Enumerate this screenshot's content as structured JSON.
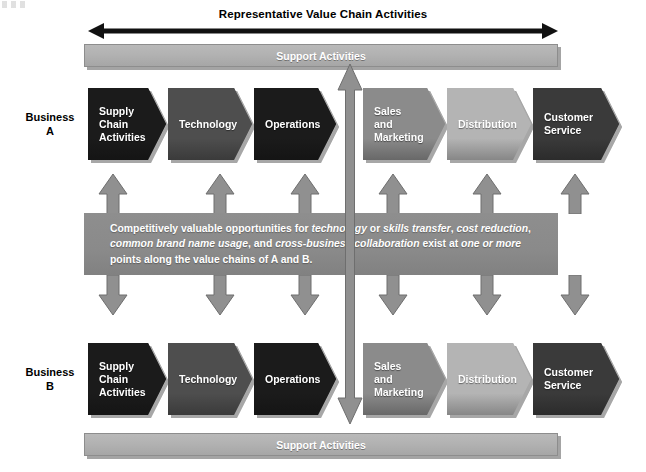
{
  "figure": {
    "top_title": "Representative Value Chain Activities",
    "support_top_label": "Support Activities",
    "support_bottom_label": "Support Activities",
    "business_a_line1": "Business",
    "business_a_line2": "A",
    "business_b_line1": "Business",
    "business_b_line2": "B",
    "center_text_parts": {
      "p1": "Competitively valuable opportunities for ",
      "i1": "technology",
      "p2": " or ",
      "i2": "skills transfer",
      "p3": ", ",
      "i3": "cost reduction",
      "p4": ", ",
      "i4": "common brand name usage",
      "p5": ", and ",
      "i5": "cross-business collaboration",
      "p6": " exist at ",
      "i6": "one or more",
      "p7": " points along the value chains of A and B."
    }
  },
  "chart_data": {
    "type": "diagram",
    "title": "Representative Value Chain Activities",
    "rows": [
      {
        "row_label": "Business A",
        "activities": [
          {
            "label": "Supply Chain Activities",
            "lines": [
              "Supply",
              "Chain",
              "Activities"
            ],
            "color": "#1b1b1b",
            "x": 88,
            "width": 78
          },
          {
            "label": "Technology",
            "lines": [
              "Technology"
            ],
            "color": "#4e4e4e",
            "x": 168,
            "width": 84
          },
          {
            "label": "Operations",
            "lines": [
              "Operations"
            ],
            "color": "#1b1b1b",
            "x": 254,
            "width": 82
          },
          {
            "label": "Sales and Marketing",
            "lines": [
              "Sales",
              "and",
              "Marketing"
            ],
            "color": "#8b8b8b",
            "x": 363,
            "width": 82
          },
          {
            "label": "Distribution",
            "lines": [
              "Distribution"
            ],
            "color": "#b4b4b4",
            "x": 447,
            "width": 84
          },
          {
            "label": "Customer Service",
            "lines": [
              "Customer",
              "Service"
            ],
            "color": "#3a3a3a",
            "x": 533,
            "width": 86
          }
        ]
      },
      {
        "row_label": "Business B",
        "activities": [
          {
            "label": "Supply Chain Activities",
            "lines": [
              "Supply",
              "Chain",
              "Activities"
            ],
            "color": "#1b1b1b",
            "x": 88,
            "width": 78
          },
          {
            "label": "Technology",
            "lines": [
              "Technology"
            ],
            "color": "#4e4e4e",
            "x": 168,
            "width": 84
          },
          {
            "label": "Operations",
            "lines": [
              "Operations"
            ],
            "color": "#1b1b1b",
            "x": 254,
            "width": 82
          },
          {
            "label": "Sales and Marketing",
            "lines": [
              "Sales",
              "and",
              "Marketing"
            ],
            "color": "#8b8b8b",
            "x": 363,
            "width": 82
          },
          {
            "label": "Distribution",
            "lines": [
              "Distribution"
            ],
            "color": "#b4b4b4",
            "x": 447,
            "width": 84
          },
          {
            "label": "Customer Service",
            "lines": [
              "Customer",
              "Service"
            ],
            "color": "#3a3a3a",
            "x": 533,
            "width": 86
          }
        ]
      }
    ],
    "connector_arrow_x": [
      98,
      205,
      290,
      378,
      472,
      560
    ],
    "colors": {
      "support_bar": "#b2b2b2",
      "center_box": "#8a8a8a",
      "arrow_gray": "#909090",
      "arrow_outline": "#6e6e6e",
      "title_black": "#000000"
    }
  }
}
